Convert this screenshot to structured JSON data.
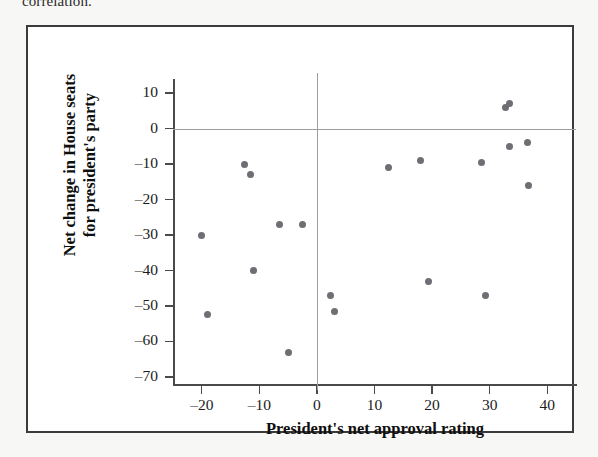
{
  "page": {
    "top_text": "correlation."
  },
  "chart_data": {
    "type": "scatter",
    "title": "",
    "xlabel": "President's net approval rating",
    "ylabel_line1": "Net change in House seats",
    "ylabel_line2": "for president's party",
    "xlim": [
      -25,
      45
    ],
    "ylim": [
      -72,
      14
    ],
    "xticks": [
      -20,
      -10,
      0,
      10,
      20,
      30,
      40
    ],
    "xtick_labels": [
      "–20",
      "–10",
      "0",
      "10",
      "20",
      "30",
      "40"
    ],
    "yticks": [
      10,
      0,
      -10,
      -20,
      -30,
      -40,
      -50,
      -60,
      -70
    ],
    "ytick_labels": [
      "10",
      "0",
      "–10",
      "–20",
      "–30",
      "–40",
      "–50",
      "–60",
      "–70"
    ],
    "grid": false,
    "legend": null,
    "reference_lines": {
      "horizontal": 0,
      "vertical": 0
    },
    "marker_color": "#6e6e74",
    "points": [
      {
        "x": -20.0,
        "y": -30
      },
      {
        "x": -19.0,
        "y": -52.5
      },
      {
        "x": -12.5,
        "y": -10
      },
      {
        "x": -11.5,
        "y": -13
      },
      {
        "x": -11.0,
        "y": -40
      },
      {
        "x": -6.5,
        "y": -27
      },
      {
        "x": -5.0,
        "y": -63
      },
      {
        "x": -2.5,
        "y": -27
      },
      {
        "x": 2.3,
        "y": -47
      },
      {
        "x": 3.0,
        "y": -51.5
      },
      {
        "x": 12.5,
        "y": -11
      },
      {
        "x": 18.0,
        "y": -9
      },
      {
        "x": 19.3,
        "y": -43
      },
      {
        "x": 28.5,
        "y": -9.5
      },
      {
        "x": 29.3,
        "y": -47
      },
      {
        "x": 32.8,
        "y": 6
      },
      {
        "x": 33.4,
        "y": 7
      },
      {
        "x": 33.5,
        "y": -5
      },
      {
        "x": 36.5,
        "y": -4
      },
      {
        "x": 36.8,
        "y": -16
      }
    ]
  }
}
